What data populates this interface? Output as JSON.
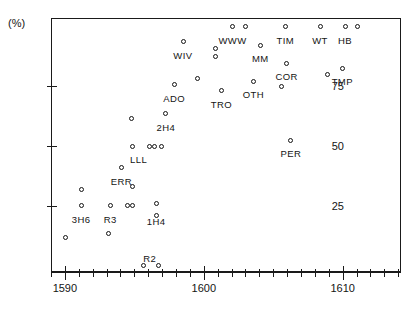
{
  "chart_data": {
    "type": "scatter",
    "title": "",
    "xlabel": "",
    "ylabel": "(%)",
    "xlim": [
      1589.0,
      1614.2
    ],
    "ylim": [
      -3.0,
      103.0
    ],
    "grid": false,
    "legend": "none",
    "x_ticks_major": [
      1590,
      1600,
      1610
    ],
    "x_tick_labels": [
      "1590",
      "1600",
      "1610"
    ],
    "x_minor_step": 1,
    "y_ticks": [
      25,
      50,
      75
    ],
    "y_tick_labels": [
      "25",
      "50",
      "75"
    ],
    "axis_unit_label": "(%)",
    "marker_style": "open-circle",
    "points": [
      {
        "x": 1590.0,
        "y": 12.0,
        "label": ""
      },
      {
        "x": 1591.1,
        "y": 25.0,
        "label": "3H6"
      },
      {
        "x": 1591.1,
        "y": 32.0,
        "label": ""
      },
      {
        "x": 1593.1,
        "y": 13.5,
        "label": ""
      },
      {
        "x": 1593.2,
        "y": 25.0,
        "label": "R3"
      },
      {
        "x": 1594.4,
        "y": 25.0,
        "label": ""
      },
      {
        "x": 1594.8,
        "y": 25.0,
        "label": ""
      },
      {
        "x": 1594.0,
        "y": 41.0,
        "label": "ERR"
      },
      {
        "x": 1594.8,
        "y": 33.0,
        "label": ""
      },
      {
        "x": 1594.8,
        "y": 50.0,
        "label": "LLL"
      },
      {
        "x": 1596.0,
        "y": 50.0,
        "label": ""
      },
      {
        "x": 1596.4,
        "y": 50.0,
        "label": ""
      },
      {
        "x": 1596.9,
        "y": 50.0,
        "label": ""
      },
      {
        "x": 1594.7,
        "y": 61.5,
        "label": ""
      },
      {
        "x": 1596.5,
        "y": 26.0,
        "label": "1H4"
      },
      {
        "x": 1596.5,
        "y": 21.0,
        "label": ""
      },
      {
        "x": 1595.6,
        "y": 0.0,
        "label": "R2"
      },
      {
        "x": 1596.7,
        "y": 0.0,
        "label": ""
      },
      {
        "x": 1597.2,
        "y": 63.5,
        "label": "2H4"
      },
      {
        "x": 1597.8,
        "y": 75.5,
        "label": "ADO"
      },
      {
        "x": 1598.5,
        "y": 93.5,
        "label": "WIV"
      },
      {
        "x": 1600.8,
        "y": 90.5,
        "label": ""
      },
      {
        "x": 1600.8,
        "y": 87.5,
        "label": ""
      },
      {
        "x": 1599.5,
        "y": 78.0,
        "label": ""
      },
      {
        "x": 1601.2,
        "y": 73.0,
        "label": "TRO"
      },
      {
        "x": 1602.0,
        "y": 100.0,
        "label": "WWW"
      },
      {
        "x": 1602.9,
        "y": 100.0,
        "label": ""
      },
      {
        "x": 1604.0,
        "y": 92.0,
        "label": "MM"
      },
      {
        "x": 1603.5,
        "y": 77.0,
        "label": "OTH"
      },
      {
        "x": 1605.8,
        "y": 100.0,
        "label": "TIM"
      },
      {
        "x": 1605.9,
        "y": 84.5,
        "label": "COR"
      },
      {
        "x": 1605.5,
        "y": 75.0,
        "label": ""
      },
      {
        "x": 1606.2,
        "y": 52.5,
        "label": "PER"
      },
      {
        "x": 1608.3,
        "y": 100.0,
        "label": "WT"
      },
      {
        "x": 1608.8,
        "y": 80.0,
        "label": ""
      },
      {
        "x": 1610.1,
        "y": 100.0,
        "label": "HB"
      },
      {
        "x": 1609.9,
        "y": 82.5,
        "label": "TMP"
      },
      {
        "x": 1611.0,
        "y": 100.0,
        "label": ""
      }
    ],
    "label_offsets": {
      "3H6": {
        "dx": 0,
        "dy": 13
      },
      "R3": {
        "dx": 0,
        "dy": 13
      },
      "ERR": {
        "dx": 0,
        "dy": 13
      },
      "LLL": {
        "dx": 6,
        "dy": 13
      },
      "1H4": {
        "dx": 0,
        "dy": 17
      },
      "R2": {
        "dx": 6,
        "dy": -8
      },
      "2H4": {
        "dx": 0,
        "dy": 13
      },
      "ADO": {
        "dx": 0,
        "dy": 13
      },
      "WIV": {
        "dx": -1,
        "dy": 13
      },
      "TRO": {
        "dx": 0,
        "dy": 13
      },
      "WWW": {
        "dx": 0,
        "dy": 14
      },
      "MM": {
        "dx": 0,
        "dy": 13
      },
      "OTH": {
        "dx": 0,
        "dy": 13
      },
      "TIM": {
        "dx": 0,
        "dy": 14
      },
      "COR": {
        "dx": 0,
        "dy": 13
      },
      "PER": {
        "dx": 0,
        "dy": 13
      },
      "WT": {
        "dx": 0,
        "dy": 14
      },
      "HB": {
        "dx": 0,
        "dy": 14
      },
      "TMP": {
        "dx": 0,
        "dy": 13
      }
    }
  },
  "figure": {
    "unit_label": "(%)",
    "cropped_header_text": ""
  }
}
